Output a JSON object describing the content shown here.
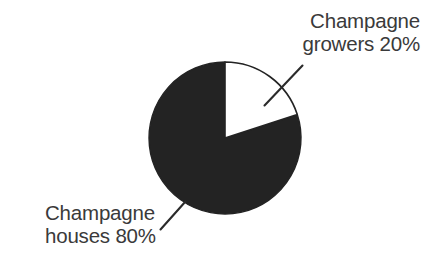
{
  "figure": {
    "background_color": "#ffffff",
    "width": 426,
    "height": 274
  },
  "chart_data": {
    "type": "pie",
    "title": "",
    "subtitle": "",
    "xlabel": "",
    "ylabel": "",
    "legend_position": "callout-labels",
    "grid": false,
    "start_angle_deg": 0,
    "direction": "clockwise",
    "categories": [
      "Champagne houses",
      "Champagne growers"
    ],
    "values": [
      80,
      20
    ],
    "units": "%",
    "slices": [
      {
        "label": "Champagne houses",
        "value": 80,
        "value_text": "80%",
        "color": "#232323",
        "start_angle_deg": 72,
        "end_angle_deg": 360
      },
      {
        "label": "Champagne growers",
        "value": 20,
        "value_text": "20%",
        "color": "#ffffff",
        "start_angle_deg": 0,
        "end_angle_deg": 72
      }
    ],
    "outline_color": "#232323"
  },
  "labels": {
    "growers": {
      "line1": "Champagne",
      "line2": "growers 20%"
    },
    "houses": {
      "line1": "Champagne",
      "line2": "houses 80%"
    }
  },
  "colors": {
    "dark_slice": "#232323",
    "light_slice": "#ffffff",
    "text": "#3a3a3a",
    "leader_line": "#2b2b2b",
    "background": "#ffffff"
  }
}
